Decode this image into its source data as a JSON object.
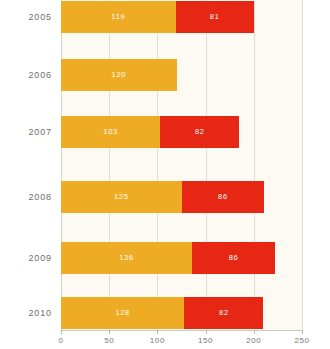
{
  "chart_data": {
    "type": "bar",
    "subtype": "stacked-horizontal-bar",
    "title": "",
    "subtitle": "",
    "xlabel": "",
    "ylabel": "",
    "orientation": "horizontal",
    "stacked": true,
    "grid": true,
    "legend_position": "none",
    "xlim": [
      0,
      250
    ],
    "xticks": [
      0,
      50,
      100,
      150,
      200,
      250
    ],
    "xtick_labels": [
      "0",
      "50",
      "100",
      "150",
      "200",
      "250"
    ],
    "categories": [
      "2005",
      "2006",
      "2007",
      "2008",
      "2009",
      "2010"
    ],
    "series": [
      {
        "name": "series-1",
        "color": "#edac23",
        "values": [
          119,
          120,
          103,
          125,
          136,
          128
        ],
        "labels": [
          "119",
          "120",
          "103",
          "125",
          "136",
          "128"
        ]
      },
      {
        "name": "series-2",
        "color": "#e52713",
        "values": [
          81,
          0,
          82,
          86,
          86,
          82
        ],
        "labels": [
          "81",
          "",
          "82",
          "86",
          "86",
          "82"
        ]
      }
    ],
    "totals": [
      200,
      120,
      185,
      211,
      222,
      210
    ]
  },
  "colors": {
    "series_1": "#edac23",
    "series_2": "#e52713",
    "plot_background": "#fcfaf3",
    "page_background": "#ffffff",
    "gridline": "#e3ddd0",
    "axis_line": "#cfc9bb",
    "tick_label": "#77777a",
    "category_label": "#6e6e70",
    "value_label": "#ffffff"
  }
}
